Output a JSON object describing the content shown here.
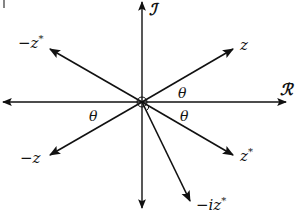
{
  "diagram": {
    "colors": {
      "stroke": "#111111",
      "background": "#ffffff"
    },
    "origin": {
      "x": 142,
      "y": 102
    },
    "axes": {
      "real": {
        "label": "ℛ",
        "from": [
          2,
          102
        ],
        "to": [
          286,
          102
        ]
      },
      "imaginary": {
        "label": "ℐ",
        "from": [
          142,
          208
        ],
        "to": [
          142,
          2
        ]
      }
    },
    "vectors": [
      {
        "name": "z",
        "label_base": "z",
        "label_sup": "",
        "tip": [
          233,
          49
        ]
      },
      {
        "name": "neg-z-conj",
        "label_base": "−z",
        "label_sup": "*",
        "tip": [
          50,
          49
        ]
      },
      {
        "name": "neg-z",
        "label_base": "−z",
        "label_sup": "",
        "tip": [
          50,
          155
        ]
      },
      {
        "name": "z-conj",
        "label_base": "z",
        "label_sup": "*",
        "tip": [
          233,
          155
        ]
      },
      {
        "name": "neg-i-z-conj",
        "label_base": "−iz",
        "label_sup": "*",
        "tip": [
          190,
          201
        ]
      }
    ],
    "angles": [
      {
        "label": "θ",
        "position": "between z and real axis"
      },
      {
        "label": "θ",
        "position": "between −z and negative real axis"
      },
      {
        "label": "θ",
        "position": "between z* and real axis"
      }
    ],
    "labels": {
      "z": "z",
      "neg_z_conj": "−z",
      "neg_z": "−z",
      "z_conj": "z",
      "neg_i_z_conj": "−iz",
      "star": "*",
      "theta": "θ",
      "real_axis": "ℛ",
      "imag_axis": "ℐ"
    }
  }
}
